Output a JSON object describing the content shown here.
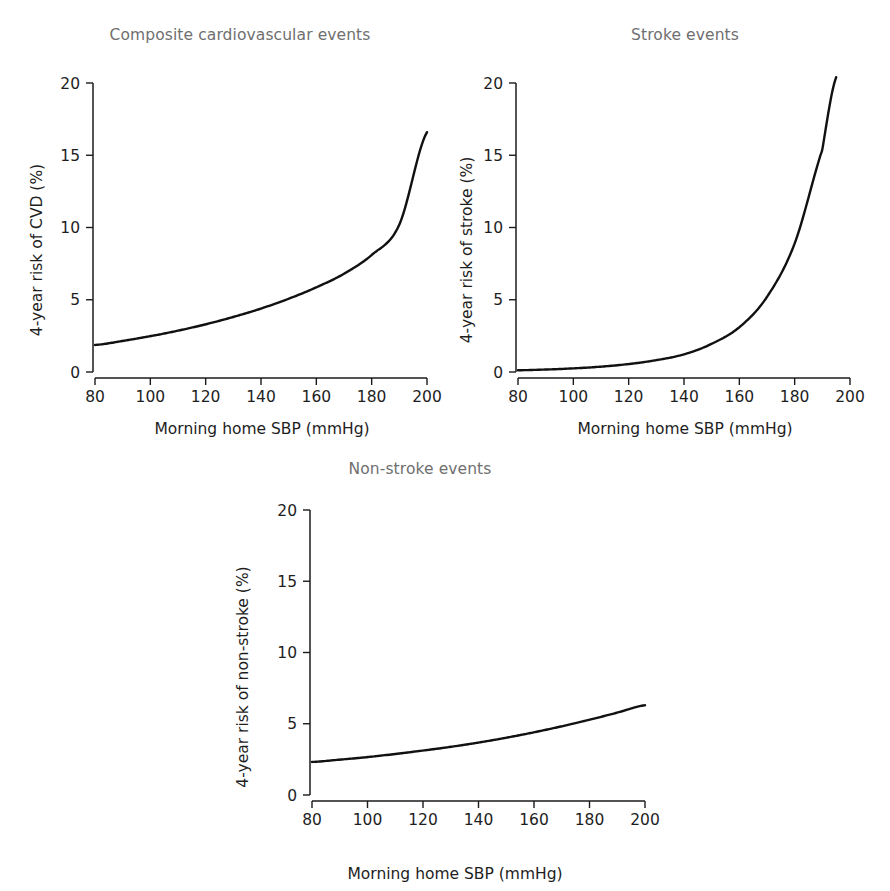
{
  "figure": {
    "background_color": "#ffffff",
    "title_color": "#6f6f6f",
    "curve_color": "#111111",
    "axis_color": "#1b1b1b"
  },
  "chart_data": [
    {
      "type": "line",
      "panel_id": "composite-cardiovascular-events",
      "title": "Composite cardiovascular events",
      "xlabel": "Morning home SBP (mmHg)",
      "ylabel": "4-year risk of CVD (%)",
      "xlim": [
        80,
        200
      ],
      "ylim": [
        0,
        20
      ],
      "xticks": [
        80,
        100,
        120,
        140,
        160,
        180,
        200
      ],
      "yticks": [
        0,
        5,
        10,
        15,
        20
      ],
      "xticklabels": [
        "80",
        "100",
        "120",
        "140",
        "160",
        "180",
        "200"
      ],
      "yticklabels": [
        "0",
        "5",
        "10",
        "15",
        "20"
      ],
      "grid": false,
      "legend": "none",
      "x": [
        80,
        90,
        100,
        110,
        120,
        130,
        140,
        150,
        160,
        170,
        180,
        190,
        200
      ],
      "y": [
        1.87,
        2.15,
        2.48,
        2.86,
        3.3,
        3.81,
        4.39,
        5.07,
        5.86,
        6.8,
        8.1,
        10.2,
        16.6
      ],
      "series": [
        {
          "name": "4-year risk of CVD",
          "x": [
            80,
            90,
            100,
            110,
            120,
            130,
            140,
            150,
            160,
            170,
            180,
            190,
            200
          ],
          "values": [
            1.87,
            2.15,
            2.48,
            2.86,
            3.3,
            3.81,
            4.39,
            5.07,
            5.86,
            6.8,
            8.1,
            10.2,
            16.6
          ]
        }
      ]
    },
    {
      "type": "line",
      "panel_id": "stroke-events",
      "title": "Stroke events",
      "xlabel": "Morning home SBP (mmHg)",
      "ylabel": "4-year risk of stroke (%)",
      "xlim": [
        80,
        200
      ],
      "ylim": [
        0,
        20
      ],
      "xticks": [
        80,
        100,
        120,
        140,
        160,
        180,
        200
      ],
      "yticks": [
        0,
        5,
        10,
        15,
        20
      ],
      "xticklabels": [
        "80",
        "100",
        "120",
        "140",
        "160",
        "180",
        "200"
      ],
      "yticklabels": [
        "0",
        "5",
        "10",
        "15",
        "20"
      ],
      "grid": false,
      "legend": "none",
      "x": [
        80,
        90,
        100,
        110,
        120,
        130,
        140,
        150,
        160,
        170,
        180,
        190,
        195
      ],
      "y": [
        0.12,
        0.17,
        0.25,
        0.37,
        0.55,
        0.82,
        1.22,
        1.95,
        3.1,
        5.2,
        8.9,
        15.4,
        20.4
      ],
      "series": [
        {
          "name": "4-year risk of stroke",
          "x": [
            80,
            90,
            100,
            110,
            120,
            130,
            140,
            150,
            160,
            170,
            180,
            190,
            195
          ],
          "values": [
            0.12,
            0.17,
            0.25,
            0.37,
            0.55,
            0.82,
            1.22,
            1.95,
            3.1,
            5.2,
            8.9,
            15.4,
            20.4
          ]
        }
      ]
    },
    {
      "type": "line",
      "panel_id": "non-stroke-events",
      "title": "Non-stroke events",
      "xlabel": "Morning home SBP (mmHg)",
      "ylabel": "4-year risk of non-stroke (%)",
      "xlim": [
        80,
        200
      ],
      "ylim": [
        0,
        20
      ],
      "xticks": [
        80,
        100,
        120,
        140,
        160,
        180,
        200
      ],
      "yticks": [
        0,
        5,
        10,
        15,
        20
      ],
      "xticklabels": [
        "80",
        "100",
        "120",
        "140",
        "160",
        "180",
        "200"
      ],
      "yticklabels": [
        "0",
        "5",
        "10",
        "15",
        "20"
      ],
      "grid": false,
      "legend": "none",
      "x": [
        80,
        90,
        100,
        110,
        120,
        130,
        140,
        150,
        160,
        170,
        180,
        190,
        200
      ],
      "y": [
        2.32,
        2.48,
        2.66,
        2.88,
        3.12,
        3.38,
        3.68,
        4.02,
        4.4,
        4.82,
        5.28,
        5.78,
        6.3
      ],
      "series": [
        {
          "name": "4-year risk of non-stroke",
          "x": [
            80,
            90,
            100,
            110,
            120,
            130,
            140,
            150,
            160,
            170,
            180,
            190,
            200
          ],
          "values": [
            2.32,
            2.48,
            2.66,
            2.88,
            3.12,
            3.38,
            3.68,
            4.02,
            4.4,
            4.82,
            5.28,
            5.78,
            6.3
          ]
        }
      ]
    }
  ]
}
